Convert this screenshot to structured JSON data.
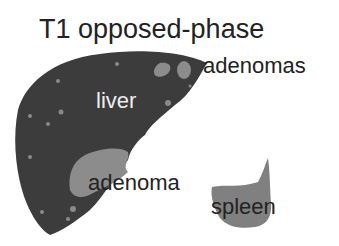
{
  "title": "T1 opposed-phase",
  "labels": {
    "liver": "liver",
    "adenomas": "adenomas",
    "adenoma": "adenoma",
    "spleen": "spleen"
  },
  "colors": {
    "liver": "#3c3c3c",
    "lesion": "#8c8c8c",
    "spleen": "#808080",
    "dots": "#8a8a8a",
    "text_dark": "#222222",
    "text_light": "#eeeeee"
  }
}
